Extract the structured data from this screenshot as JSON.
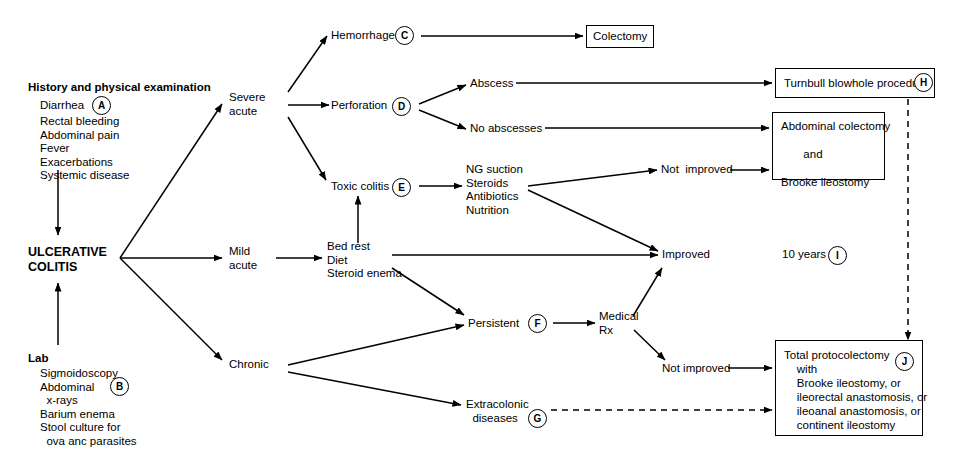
{
  "diagram": {
    "line_color": "#000000",
    "background": "#ffffff"
  },
  "left_column": {
    "history_header": "History and physical examination",
    "history_items_line1": "Diarrhea",
    "history_items_rest": "Rectal bleeding\nAbdominal pain\nFever\nExacerbations\nSystemic disease",
    "history_marker": "A",
    "diagnosis": "ULCERATIVE\nCOLITIS",
    "lab_header": "Lab",
    "lab_items": "Sigmoidoscopy\nAbdominal\n  x-rays\nBarium enema\nStool culture for\n  ova anc parasites",
    "lab_marker": "B"
  },
  "severity": {
    "severe": "Severe\nacute",
    "mild": "Mild\nacute",
    "chronic": "Chronic"
  },
  "severe_branch": {
    "hemorrhage": "Hemorrhage",
    "hemorrhage_marker": "C",
    "colectomy_box": "Colectomy",
    "perforation": "Perforation",
    "perforation_marker": "D",
    "abscess": "Abscess",
    "no_abscesses": "No abscesses",
    "toxic_colitis": "Toxic colitis",
    "toxic_colitis_marker": "E",
    "toxic_treatment": "NG suction\nSteroids\nAntibiotics\nNutrition"
  },
  "mild_branch": {
    "treatment": "Bed rest\nDiet\nSteroid enema"
  },
  "chronic_branch": {
    "persistent": "Persistent",
    "persistent_marker": "F",
    "medical_rx": "Medical\nRx",
    "extracolonic": "Extracolonic\n  diseases",
    "extracolonic_marker": "G"
  },
  "outcomes": {
    "not_improved_toxic": "Not  improved",
    "improved": "Improved",
    "ten_years": "10 years",
    "ten_years_marker": "I",
    "not_improved_medical": "Not improved"
  },
  "surgery_boxes": {
    "turnbull": "Turnbull blowhole procedure",
    "turnbull_marker": "H",
    "abdominal_colectomy": "Abdominal colectomy\n\n       and\n\nBrooke ileostomy",
    "total_proctocolectomy": "Total protocolectomy\n    with\n    Brooke ileostomy, or\n    ileorectal anastomosis, or\n    ileoanal anastomosis, or\n    continent ileostomy",
    "total_proctocolectomy_marker": "J"
  }
}
